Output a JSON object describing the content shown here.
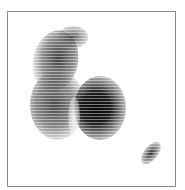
{
  "image": {
    "kind": "grayscale-scan",
    "frame_color": "#8a8a8a",
    "background": "#ffffff",
    "regions": [
      {
        "name": "upper-lobe",
        "intensity": "medium"
      },
      {
        "name": "left-lobe",
        "intensity": "medium"
      },
      {
        "name": "right-lobe",
        "intensity": "high"
      },
      {
        "name": "small-spot",
        "intensity": "medium"
      }
    ]
  }
}
